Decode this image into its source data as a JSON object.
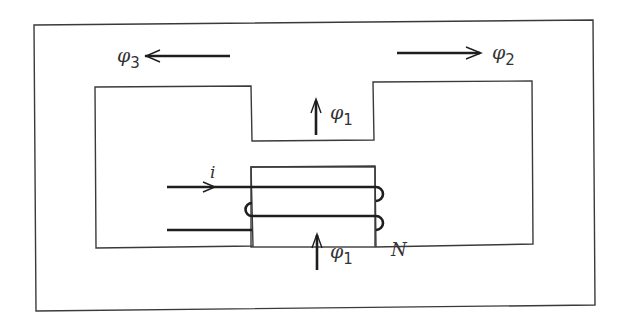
{
  "diagram": {
    "labels": {
      "phi3": {
        "symbol": "φ",
        "sub": "3"
      },
      "phi2": {
        "symbol": "φ",
        "sub": "2"
      },
      "phi1_top": {
        "symbol": "φ",
        "sub": "1"
      },
      "phi1_bottom": {
        "symbol": "φ",
        "sub": "1"
      },
      "current": "i",
      "turns": "N"
    },
    "colors": {
      "line": "#3a3a3a",
      "wire": "#1e1e1e",
      "background": "#ffffff"
    }
  }
}
